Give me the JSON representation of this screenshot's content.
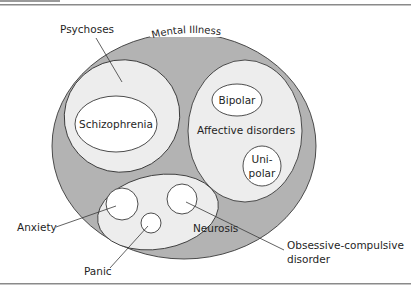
{
  "diagram": {
    "type": "nested-ellipse (Euler) diagram",
    "colors": {
      "outer_fill": "#b3b3b3",
      "inner_fill": "#ededed",
      "leaf_fill": "#ffffff",
      "stroke": "#3a3a3a",
      "rule": "#8a8a8a"
    },
    "outer": {
      "label": "Mental Illness"
    },
    "groups": [
      {
        "id": "psychoses",
        "label": "Psychoses",
        "children": [
          {
            "id": "schizophrenia",
            "label": "Schizophrenia"
          }
        ]
      },
      {
        "id": "affective",
        "label": "Affective disorders",
        "children": [
          {
            "id": "bipolar",
            "label": "Bipolar"
          },
          {
            "id": "unipolar",
            "label_line1": "Uni-",
            "label_line2": "polar"
          }
        ]
      },
      {
        "id": "neurosis",
        "label": "Neurosis",
        "children": [
          {
            "id": "anxiety",
            "label": "Anxiety"
          },
          {
            "id": "panic",
            "label": "Panic"
          },
          {
            "id": "ocd",
            "label_line1": "Obsessive-compulsive",
            "label_line2": "disorder"
          }
        ]
      }
    ]
  }
}
